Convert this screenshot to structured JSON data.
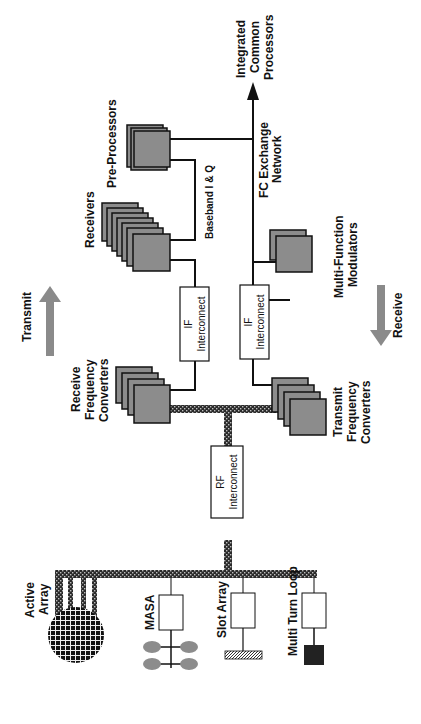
{
  "diagram": {
    "orientation": "rotated 90deg counter-clockwise",
    "colors": {
      "module_fill": "#8c8c8c",
      "arrow_fill": "#8a8a8a",
      "bus_fill": "#2a2a2a",
      "line": "#111111",
      "masa_elements": "#8c8c8c",
      "multi_turn_loop": "#222222"
    },
    "labels": {
      "pre_processors": "Pre-Processors",
      "receivers": "Receivers",
      "baseband": "Baseband I & Q",
      "integrated_1": "Integrated",
      "integrated_2": "Common",
      "integrated_3": "Processors",
      "fc_1": "FC Exchange",
      "fc_2": "Network",
      "mfm_1": "Multi-Function",
      "mfm_2": "Modulators",
      "transmit": "Transmit",
      "receive": "Receive",
      "rfc_1": "Receive",
      "rfc_2": "Frequency",
      "rfc_3": "Converters",
      "tfc_1": "Transmit",
      "tfc_2": "Frequency",
      "tfc_3": "Converters",
      "if_top_1": "IF",
      "if_top_2": "Interconnect",
      "if_bot_1": "IF",
      "if_bot_2": "Interconnect",
      "rf_1": "RF",
      "rf_2": "Interconnect",
      "active_1": "Active",
      "active_2": "Array",
      "masa": "MASA",
      "slot_array": "Slot Array",
      "multi_turn_loop": "Multi Turn Loop"
    }
  }
}
